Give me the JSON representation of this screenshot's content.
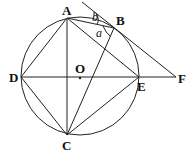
{
  "diagram": {
    "points": {
      "A": {
        "label": "A",
        "x": 67,
        "y": 18
      },
      "B": {
        "label": "B",
        "x": 114,
        "y": 28
      },
      "C": {
        "label": "C",
        "x": 67,
        "y": 135
      },
      "D": {
        "label": "D",
        "x": 21,
        "y": 77
      },
      "E": {
        "label": "E",
        "x": 139,
        "y": 77
      },
      "F": {
        "label": "F",
        "x": 176,
        "y": 77
      },
      "O": {
        "label": "O",
        "x": 80,
        "y": 77
      }
    },
    "angles": {
      "a": "a",
      "b": "b"
    },
    "circle": {
      "cx": 80,
      "cy": 76,
      "r": 59
    }
  }
}
